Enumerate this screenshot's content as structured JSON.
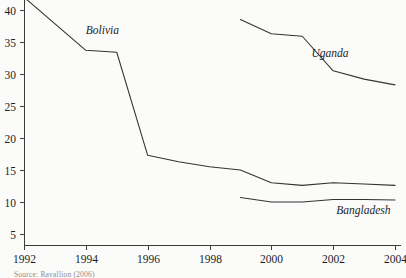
{
  "chart_data": {
    "type": "line",
    "title": "",
    "subtitle": "",
    "xlabel": "",
    "ylabel": "",
    "xlim": [
      1992,
      2004
    ],
    "ylim": [
      0,
      43
    ],
    "grid": false,
    "legend_position": "inline-labels",
    "x_ticks": [
      1992,
      1994,
      1996,
      1998,
      2000,
      2002,
      2004
    ],
    "x_tick_labels": [
      "1992",
      "1994",
      "1996",
      "1998",
      "2000",
      "2002",
      "2004"
    ],
    "y_ticks": [
      5,
      10,
      15,
      20,
      25,
      30,
      35,
      40
    ],
    "y_tick_labels": [
      "5",
      "10",
      "15",
      "20",
      "25",
      "30",
      "35",
      "40"
    ],
    "series": [
      {
        "name": "Bolivia",
        "label": "Bolivia",
        "label_x": 1994.0,
        "label_y": 36.2,
        "x": [
          1992,
          1994,
          1995,
          1996,
          1997,
          1998,
          1999,
          2000,
          2001,
          2002,
          2003,
          2004
        ],
        "values": [
          42.0,
          33.7,
          33.4,
          17.3,
          16.3,
          15.5,
          15.0,
          13.0,
          12.6,
          13.0,
          12.8,
          12.6
        ]
      },
      {
        "name": "Uganda",
        "label": "Uganda",
        "label_x": 2001.3,
        "label_y": 32.6,
        "x": [
          1999,
          2000,
          2001,
          2002,
          2003,
          2004
        ],
        "values": [
          38.5,
          36.3,
          35.9,
          30.5,
          29.2,
          28.3
        ]
      },
      {
        "name": "Bangladesh",
        "label": "Bangladesh",
        "label_x": 2002.1,
        "label_y": 8.2,
        "x": [
          1999,
          2000,
          2001,
          2002,
          2003,
          2004
        ],
        "values": [
          10.7,
          10.0,
          10.0,
          10.4,
          10.4,
          10.3
        ]
      }
    ]
  },
  "source": {
    "note": "Source: Ravallion (2006)"
  },
  "colors": {
    "line": "#333333",
    "axis": "#3c3c3c",
    "text": "#1d1d1d",
    "background": "#fbfbfa"
  }
}
